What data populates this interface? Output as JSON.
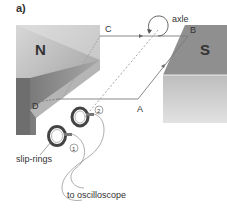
{
  "figure": {
    "panel_label": "a)",
    "magnets": {
      "north": "N",
      "south": "S"
    },
    "coil_corners": {
      "a": "A",
      "b": "B",
      "c": "C",
      "d": "D"
    },
    "axle_label": "axle",
    "slip_rings_label": "slip-rings",
    "ring_numbers": [
      "1",
      "2"
    ],
    "oscilloscope_label": "to oscilloscope"
  }
}
